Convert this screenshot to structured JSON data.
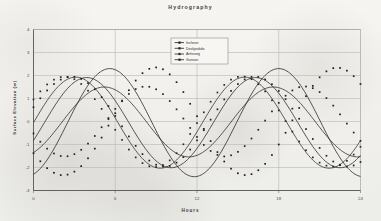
{
  "chart_data": {
    "type": "line",
    "title": "Hydrography",
    "xlabel": "Hours",
    "ylabel": "Surface Elevation (m)",
    "xlim": [
      0,
      24
    ],
    "ylim": [
      -3,
      4
    ],
    "xticks": [
      "0",
      "6",
      "12",
      "18",
      "24"
    ],
    "yticks": [
      "4",
      "3",
      "2",
      "1",
      "0",
      "-1",
      "-2",
      "-3"
    ],
    "grid": "horizontal-and-vertical",
    "legend_position": "top-center-inside",
    "markers": "small filled squares on every data point",
    "period_hours": 12.4,
    "series": [
      {
        "name": "Incheon",
        "amplitude": 2.35,
        "mean": -0.05,
        "phase_peak_hours": 5.6,
        "x": [
          0,
          0.5,
          1,
          1.5,
          2,
          2.5,
          3,
          3.5,
          4,
          4.5,
          5,
          5.5,
          6,
          6.5,
          7,
          7.5,
          8,
          8.5,
          9,
          9.5,
          10,
          10.5,
          11,
          11.5,
          12,
          12.5,
          13,
          13.5,
          14,
          14.5,
          15,
          15.5,
          16,
          16.5,
          17,
          17.5,
          18,
          18.5,
          19,
          19.5,
          20,
          20.5,
          21,
          21.5,
          22,
          22.5,
          23,
          23.5,
          24
        ],
        "values": [
          -1.38,
          -1.73,
          -2.03,
          -2.23,
          -2.33,
          -2.31,
          -2.18,
          -1.94,
          -1.6,
          -1.18,
          -0.7,
          -0.18,
          0.36,
          0.88,
          1.36,
          1.78,
          2.1,
          2.29,
          2.35,
          2.27,
          2.05,
          1.71,
          1.28,
          0.77,
          0.23,
          -0.32,
          -0.85,
          -1.33,
          -1.74,
          -2.05,
          -2.25,
          -2.33,
          -2.29,
          -2.12,
          -1.84,
          -1.46,
          -1.0,
          -0.49,
          0.05,
          0.59,
          1.1,
          1.55,
          1.92,
          2.18,
          2.32,
          2.33,
          2.21,
          1.97,
          1.63
        ]
      },
      {
        "name": "Deokjeokdo",
        "amplitude": 1.52,
        "mean": -0.02,
        "phase_peak_hours": 5.2,
        "x": [
          0,
          0.5,
          1,
          1.5,
          2,
          2.5,
          3,
          3.5,
          4,
          4.5,
          5,
          5.5,
          6,
          6.5,
          7,
          7.5,
          8,
          8.5,
          9,
          9.5,
          10,
          10.5,
          11,
          11.5,
          12,
          12.5,
          13,
          13.5,
          14,
          14.5,
          15,
          15.5,
          16,
          16.5,
          17,
          17.5,
          18,
          18.5,
          19,
          19.5,
          20,
          20.5,
          21,
          21.5,
          22,
          22.5,
          23,
          23.5,
          24
        ],
        "values": [
          -0.52,
          -0.88,
          -1.18,
          -1.39,
          -1.5,
          -1.51,
          -1.42,
          -1.23,
          -0.96,
          -0.63,
          -0.25,
          0.15,
          0.55,
          0.91,
          1.2,
          1.41,
          1.51,
          1.51,
          1.4,
          1.19,
          0.89,
          0.53,
          0.13,
          -0.28,
          -0.67,
          -1.02,
          -1.28,
          -1.45,
          -1.52,
          -1.47,
          -1.32,
          -1.07,
          -0.74,
          -0.36,
          0.04,
          0.44,
          0.81,
          1.12,
          1.35,
          1.49,
          1.52,
          1.45,
          1.28,
          1.02,
          0.69,
          0.31,
          -0.09,
          -0.48,
          -0.84
        ]
      },
      {
        "name": "Anheung",
        "amplitude": 1.98,
        "mean": -0.05,
        "phase_peak_hours": 3.1,
        "x": [
          0,
          0.5,
          1,
          1.5,
          2,
          2.5,
          3,
          3.5,
          4,
          4.5,
          5,
          5.5,
          6,
          6.5,
          7,
          7.5,
          8,
          8.5,
          9,
          9.5,
          10,
          10.5,
          11,
          11.5,
          12,
          12.5,
          13,
          13.5,
          14,
          14.5,
          15,
          15.5,
          16,
          16.5,
          17,
          17.5,
          18,
          18.5,
          19,
          19.5,
          20,
          20.5,
          21,
          21.5,
          22,
          22.5,
          23,
          23.5,
          24
        ],
        "values": [
          0.96,
          1.31,
          1.61,
          1.82,
          1.93,
          1.94,
          1.84,
          1.63,
          1.34,
          0.97,
          0.55,
          0.1,
          -0.36,
          -0.8,
          -1.22,
          -1.56,
          -1.81,
          -1.95,
          -1.98,
          -1.89,
          -1.69,
          -1.38,
          -0.99,
          -0.54,
          -0.07,
          0.4,
          0.86,
          1.26,
          1.59,
          1.82,
          1.94,
          1.95,
          1.84,
          1.62,
          1.31,
          0.92,
          0.48,
          0.02,
          -0.44,
          -0.87,
          -1.25,
          -1.56,
          -1.79,
          -1.92,
          -1.96,
          -1.88,
          -1.71,
          -1.44,
          -1.1
        ]
      },
      {
        "name": "Gunsan",
        "amplitude": 1.96,
        "mean": -0.05,
        "phase_peak_hours": 3.9,
        "x": [
          0,
          0.5,
          1,
          1.5,
          2,
          2.5,
          3,
          3.5,
          4,
          4.5,
          5,
          5.5,
          6,
          6.5,
          7,
          7.5,
          8,
          8.5,
          9,
          9.5,
          10,
          10.5,
          11,
          11.5,
          12,
          12.5,
          13,
          13.5,
          14,
          14.5,
          15,
          15.5,
          16,
          16.5,
          17,
          17.5,
          18,
          18.5,
          19,
          19.5,
          20,
          20.5,
          21,
          21.5,
          22,
          22.5,
          23,
          23.5,
          24
        ],
        "values": [
          0.62,
          1.01,
          1.35,
          1.63,
          1.82,
          1.93,
          1.94,
          1.85,
          1.67,
          1.4,
          1.06,
          0.67,
          0.24,
          -0.21,
          -0.65,
          -1.06,
          -1.42,
          -1.7,
          -1.88,
          -1.96,
          -1.93,
          -1.79,
          -1.55,
          -1.22,
          -0.82,
          -0.38,
          0.08,
          0.53,
          0.96,
          1.33,
          1.63,
          1.83,
          1.94,
          1.94,
          1.83,
          1.62,
          1.33,
          0.97,
          0.56,
          0.12,
          -0.33,
          -0.76,
          -1.15,
          -1.49,
          -1.74,
          -1.9,
          -1.96,
          -1.91,
          -1.76
        ]
      }
    ]
  }
}
